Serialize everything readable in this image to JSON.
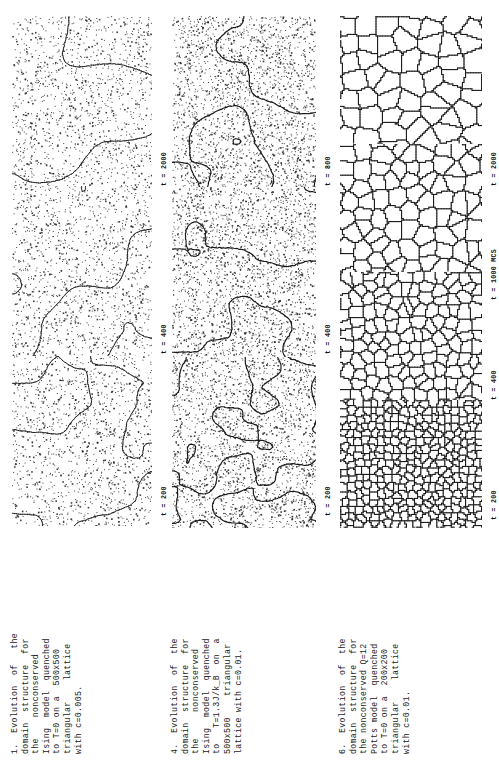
{
  "page": {
    "background_color": "#ffffff",
    "ink_color": "#111111",
    "orientation": "rotated-90-ccw"
  },
  "figures": [
    {
      "id": "figure-1",
      "number": "1.",
      "caption": "1.  Evolution  of   the\ndomain  structure  for\nthe    nonconserved\nIsing  model  quenched\nto T=0 on a  500x500\ntriangular    lattice\nwith c=0.005.",
      "caption_lines": [
        "1.  Evolution  of   the",
        "domain  structure  for",
        "the    nonconserved",
        "Ising  model  quenched",
        "to T=0 on a  500x500",
        "triangular    lattice",
        "with c=0.005."
      ],
      "model": "nonconserved Ising model",
      "quench_temperature": "T=0",
      "lattice": "500x500 triangular lattice",
      "concentration": "c=0.005",
      "time_labels": [
        "t = 2000",
        "t = 400",
        "t = 200"
      ],
      "seed": 1207,
      "style": "ising-coarse",
      "blob_scale": 46,
      "noise_density": 0.055,
      "line_width": 0.9
    },
    {
      "id": "figure-4",
      "number": "4.",
      "caption": "4.  Evolution  of  the\ndomain  structure  for\nthe     nonconserved\nIsing  model  quenched\nto   T=1.3J/k_B  on  a\n500x500    triangular\nlattice with c=0.01.",
      "caption_lines": [
        "4.  Evolution  of  the",
        "domain  structure  for",
        "the     nonconserved",
        "Ising  model  quenched",
        "to   T=1.3J/kB  on  a",
        "500x500    triangular",
        "lattice with c=0.01."
      ],
      "model": "nonconserved Ising model",
      "quench_temperature": "T=1.3J/kB",
      "lattice": "500x500 triangular lattice",
      "concentration": "c=0.01",
      "time_labels": [
        "t = 800",
        "t = 400",
        "t = 200"
      ],
      "seed": 4412,
      "style": "ising-fine",
      "blob_scale": 30,
      "noise_density": 0.085,
      "line_width": 1.15
    },
    {
      "id": "figure-6",
      "number": "6.",
      "caption": "6.  Evolution  of  the\ndomain  structure  for\nthe nonconserved Q=12\nPotts model  quenched\nto T=0 on a  200x200\ntriangular    lattice\nwith c=0.01.",
      "caption_lines": [
        "6.  Evolution  of  the",
        "domain  structure  for",
        "the nonconserved Q=12",
        "Potts model  quenched",
        "to T=0 on a  200x200",
        "triangular    lattice",
        "with c=0.01."
      ],
      "model": "nonconserved Q=12 Potts model",
      "quench_temperature": "T=0",
      "lattice": "200x200 triangular lattice",
      "concentration": "c=0.01",
      "time_labels": [
        "t = 2000",
        "t = 1000 MCS",
        "t = 400",
        "t = 200"
      ],
      "seed": 6619,
      "style": "potts",
      "blob_scale": 22,
      "noise_density": 0.0,
      "line_width": 1.0
    }
  ]
}
